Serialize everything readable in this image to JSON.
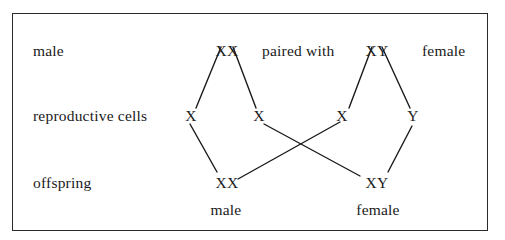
{
  "diagram": {
    "row_labels": {
      "parents": "male",
      "gametes": "reproductive cells",
      "offspring": "offspring"
    },
    "parents": {
      "left": {
        "genotype": "XX",
        "sex": "male"
      },
      "connector": "paired with",
      "right": {
        "genotype": "XY",
        "sex": "female"
      }
    },
    "gametes": [
      "X",
      "X",
      "X",
      "Y"
    ],
    "offspring": [
      {
        "genotype": "XX",
        "sex": "male"
      },
      {
        "genotype": "XY",
        "sex": "female"
      }
    ],
    "edges": [
      {
        "from": "parent-XX",
        "to": "gamete-1"
      },
      {
        "from": "parent-XX",
        "to": "gamete-2"
      },
      {
        "from": "parent-XY",
        "to": "gamete-3"
      },
      {
        "from": "parent-XY",
        "to": "gamete-4"
      },
      {
        "from": "gamete-1",
        "to": "offspring-XX"
      },
      {
        "from": "gamete-3",
        "to": "offspring-XX"
      },
      {
        "from": "gamete-2",
        "to": "offspring-XY"
      },
      {
        "from": "gamete-4",
        "to": "offspring-XY"
      }
    ],
    "colors": {
      "ink": "#1a1a1a",
      "border": "#2b2b2b",
      "background": "#ffffff"
    }
  }
}
